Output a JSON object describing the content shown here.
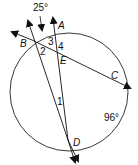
{
  "diagram": {
    "points": {
      "A": "A",
      "B": "B",
      "C": "C",
      "D": "D",
      "E": "E"
    },
    "angles": {
      "a1": "1",
      "a2": "2",
      "a3": "3",
      "a4": "4"
    },
    "measures": {
      "top_angle": "25°",
      "arc_DC": "96°"
    }
  }
}
